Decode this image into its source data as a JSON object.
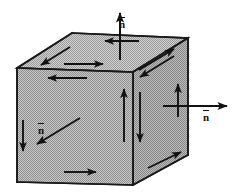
{
  "figure": {
    "type": "geometric-diagram",
    "background_color": "#ffffff",
    "face_fill_color": "#b4b4b4",
    "edge_color": "#1a1a1a",
    "arrow_color": "#121212",
    "canvas": {
      "width": 234,
      "height": 196
    }
  },
  "labels": {
    "normal_top": "n",
    "normal_right": "n",
    "normal_front": "n",
    "overbar": true
  },
  "solid": {
    "name": "cube",
    "projection": "oblique",
    "vertices": {
      "front_top_left": [
        17,
        68
      ],
      "front_top_right": [
        133,
        72
      ],
      "front_bottom_left": [
        17,
        182
      ],
      "front_bottom_right": [
        133,
        185
      ],
      "back_top_left": [
        72,
        33
      ],
      "back_top_right": [
        188,
        38
      ],
      "back_bottom_right": [
        188,
        155
      ]
    },
    "faces": [
      {
        "name": "front-face",
        "shading": "halftone-gray"
      },
      {
        "name": "top-face",
        "shading": "halftone-gray"
      },
      {
        "name": "right-face",
        "shading": "halftone-gray"
      }
    ]
  },
  "normals": [
    {
      "name": "normal-top",
      "face": "top-face",
      "direction": "up",
      "label": "n",
      "from": [
        120,
        60
      ],
      "to": [
        120,
        12
      ]
    },
    {
      "name": "normal-right",
      "face": "right-face",
      "direction": "right",
      "label": "n",
      "from": [
        163,
        106
      ],
      "to": [
        228,
        106
      ]
    },
    {
      "name": "normal-front",
      "face": "front-face",
      "direction": "down-left (out of page)",
      "label": "n",
      "from": [
        80,
        119
      ],
      "to": [
        36,
        145
      ]
    }
  ],
  "circulation_arrows": [
    {
      "name": "top-face-arrow-left-in",
      "face": "top-face",
      "direction": "left",
      "from": [
        138,
        41
      ],
      "to": [
        104,
        41
      ]
    },
    {
      "name": "top-face-arrow-diag-down-left",
      "face": "top-face",
      "direction": "down-left",
      "from": [
        69,
        47
      ],
      "to": [
        40,
        65
      ]
    },
    {
      "name": "top-face-arrow-right",
      "face": "top-face",
      "direction": "right",
      "from": [
        63,
        64
      ],
      "to": [
        103,
        64
      ]
    },
    {
      "name": "top-face-arrow-diag-up-right",
      "face": "top-face",
      "direction": "up-right",
      "from": [
        139,
        70
      ],
      "to": [
        175,
        48
      ]
    },
    {
      "name": "top-face-arrow-diag-down-left-2",
      "face": "top-face",
      "direction": "down-left",
      "from": [
        175,
        55
      ],
      "to": [
        139,
        77
      ]
    },
    {
      "name": "front-face-arrow-left",
      "face": "front-face",
      "direction": "left",
      "from": [
        86,
        78
      ],
      "to": [
        47,
        78
      ]
    },
    {
      "name": "front-face-arrow-down",
      "face": "front-face",
      "direction": "down",
      "from": [
        23,
        120
      ],
      "to": [
        23,
        152
      ]
    },
    {
      "name": "front-face-arrow-up",
      "face": "front-face",
      "direction": "up",
      "from": [
        124,
        142
      ],
      "to": [
        124,
        88
      ]
    },
    {
      "name": "front-face-arrow-right",
      "face": "front-face",
      "direction": "right",
      "from": [
        63,
        172
      ],
      "to": [
        96,
        172
      ]
    },
    {
      "name": "right-face-arrow-down",
      "face": "right-face",
      "direction": "down",
      "from": [
        140,
        92
      ],
      "to": [
        140,
        143
      ]
    },
    {
      "name": "right-face-arrow-up",
      "face": "right-face",
      "direction": "up",
      "from": [
        178,
        117
      ],
      "to": [
        178,
        83
      ]
    },
    {
      "name": "right-face-arrow-diag-up-right",
      "face": "right-face",
      "direction": "up-right",
      "from": [
        147,
        168
      ],
      "to": [
        182,
        152
      ]
    }
  ]
}
